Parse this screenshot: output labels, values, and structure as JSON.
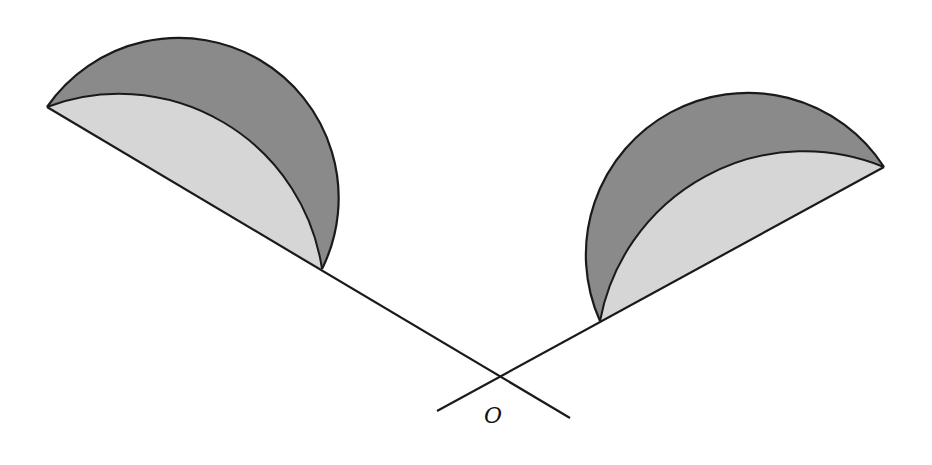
{
  "figure": {
    "type": "geometry-diagram",
    "point_label": "O",
    "colors": {
      "stroke": "#1a1a1a",
      "outer_fill": "#8a8a8a",
      "inner_fill": "#d6d6d6",
      "background": "#ffffff"
    },
    "intersection": {
      "x": 497,
      "y": 378
    },
    "lines": [
      {
        "name": "left-line",
        "from": [
          47,
          107
        ],
        "to": [
          570,
          418
        ]
      },
      {
        "name": "right-line",
        "from": [
          437,
          411
        ],
        "to": [
          884,
          167
        ]
      }
    ],
    "semicircles": [
      {
        "name": "left-semicircle",
        "chord_start": [
          47,
          107
        ],
        "chord_end": [
          322,
          269
        ],
        "outer_radius": 160,
        "inner_radius": 205
      },
      {
        "name": "right-semicircle",
        "chord_start": [
          600,
          321
        ],
        "chord_end": [
          884,
          167
        ],
        "outer_radius": 162,
        "inner_radius": 208
      }
    ]
  }
}
